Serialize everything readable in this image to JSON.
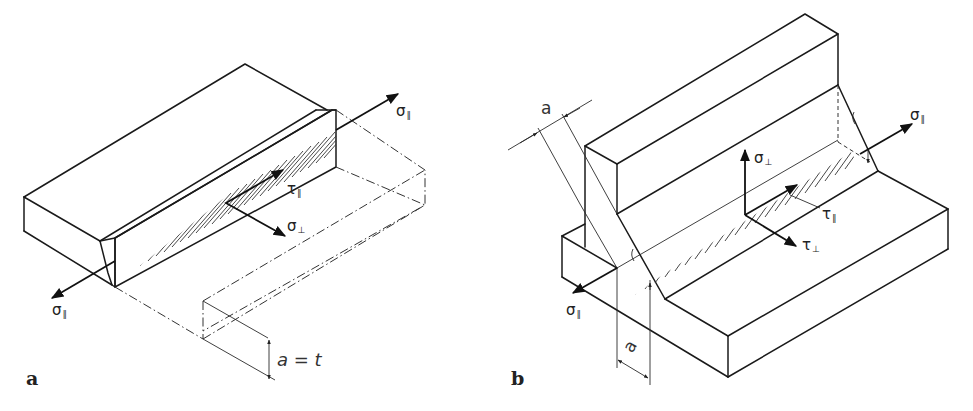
{
  "figure": {
    "panels": [
      {
        "id": "a",
        "label": "a",
        "description": "Butt weld (full penetration) with stresses in weld plane",
        "stress_labels": {
          "sigma_parallel_front": {
            "symbol": "σ",
            "sub": "∥"
          },
          "sigma_parallel_back": {
            "symbol": "σ",
            "sub": "∥"
          },
          "tau_parallel": {
            "symbol": "τ",
            "sub": "∥"
          },
          "sigma_perp": {
            "symbol": "σ",
            "sub": "⊥"
          }
        },
        "dimension": "a = t"
      },
      {
        "id": "b",
        "label": "b",
        "description": "Fillet weld T-joint with stresses in throat plane",
        "stress_labels": {
          "sigma_parallel_front": {
            "symbol": "σ",
            "sub": "∥"
          },
          "sigma_parallel_back": {
            "symbol": "σ",
            "sub": "∥"
          },
          "sigma_perp": {
            "symbol": "σ",
            "sub": "⊥"
          },
          "tau_parallel": {
            "symbol": "τ",
            "sub": "∥"
          },
          "tau_perp": {
            "symbol": "τ",
            "sub": "⊥"
          }
        },
        "dimension_top": "a",
        "dimension_bottom": "a"
      }
    ]
  }
}
